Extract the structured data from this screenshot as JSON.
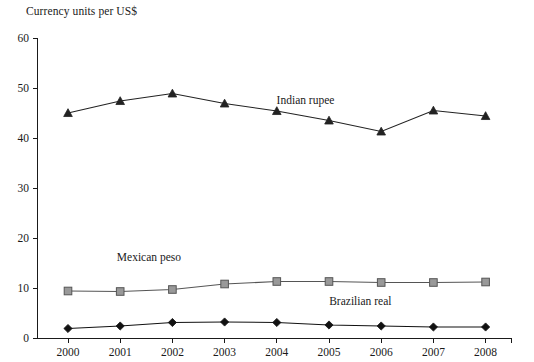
{
  "chart_data": {
    "type": "line",
    "title": "Currency units per US$",
    "xlabel": "",
    "ylabel": "",
    "ylim": [
      0,
      60
    ],
    "yticks": [
      0,
      10,
      20,
      30,
      40,
      50,
      60
    ],
    "grid": false,
    "legend_position": "inline-annotations",
    "categories": [
      "2000",
      "2001",
      "2002",
      "2003",
      "2004",
      "2005",
      "2006",
      "2007",
      "2008"
    ],
    "series": [
      {
        "name": "Indian rupee",
        "marker": "triangle",
        "color": "#222222",
        "values": [
          45.0,
          47.4,
          48.9,
          46.9,
          45.4,
          43.5,
          41.3,
          45.5,
          44.4
        ]
      },
      {
        "name": "Mexican peso",
        "marker": "square",
        "color": "#555555",
        "marker_fill": "#999999",
        "values": [
          9.4,
          9.3,
          9.7,
          10.8,
          11.3,
          11.3,
          11.1,
          11.1,
          11.2
        ]
      },
      {
        "name": "Brazilian real",
        "marker": "diamond",
        "color": "#111111",
        "values": [
          1.9,
          2.4,
          3.1,
          3.2,
          3.1,
          2.6,
          2.4,
          2.2,
          2.2
        ]
      }
    ],
    "annotations": [
      {
        "text": "Indian rupee",
        "x": 2004.55,
        "y": 46.8
      },
      {
        "text": "Mexican peso",
        "x": 2001.55,
        "y": 15.5
      },
      {
        "text": "Brazilian real",
        "x": 2005.6,
        "y": 6.6
      }
    ]
  }
}
